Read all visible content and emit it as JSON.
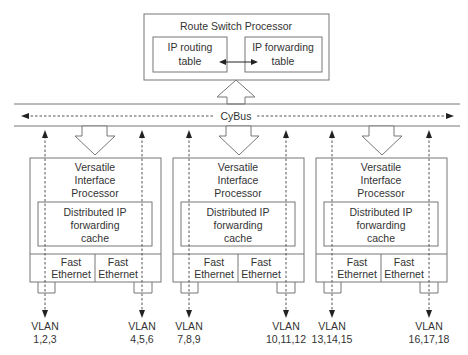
{
  "rsp": {
    "title": "Route Switch Processor",
    "routing_table": [
      "IP routing",
      "table"
    ],
    "forwarding_table": [
      "IP forwarding",
      "table"
    ]
  },
  "bus": {
    "label": "CyBus"
  },
  "vips": [
    {
      "title": [
        "Versatile",
        "Interface",
        "Processor"
      ],
      "cache": [
        "Distributed IP",
        "forwarding",
        "cache"
      ],
      "ports": [
        [
          "Fast",
          "Ethernet"
        ],
        [
          "Fast",
          "Ethernet"
        ]
      ],
      "vlans": [
        [
          "VLAN",
          "1,2,3"
        ],
        [
          "VLAN",
          "4,5,6"
        ]
      ]
    },
    {
      "title": [
        "Versatile",
        "Interface",
        "Processor"
      ],
      "cache": [
        "Distributed IP",
        "forwarding",
        "cache"
      ],
      "ports": [
        [
          "Fast",
          "Ethernet"
        ],
        [
          "Fast",
          "Ethernet"
        ]
      ],
      "vlans": [
        [
          "VLAN",
          "7,8,9"
        ],
        [
          "VLAN",
          "10,11,12"
        ]
      ]
    },
    {
      "title": [
        "Versatile",
        "Interface",
        "Processor"
      ],
      "cache": [
        "Distributed IP",
        "forwarding",
        "cache"
      ],
      "ports": [
        [
          "Fast",
          "Ethernet"
        ],
        [
          "Fast",
          "Ethernet"
        ]
      ],
      "vlans": [
        [
          "VLAN",
          "13,14,15"
        ],
        [
          "VLAN",
          "16,17,18"
        ]
      ]
    }
  ],
  "colors": {
    "stroke": "#777777",
    "text": "#333333",
    "arrow": "#222222"
  }
}
